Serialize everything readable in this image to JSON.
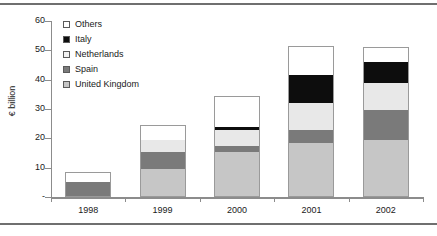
{
  "chart_data": {
    "type": "bar",
    "stacked": true,
    "title": "",
    "xlabel": "",
    "ylabel": "€ billion",
    "categories": [
      "1998",
      "1999",
      "2000",
      "2001",
      "2002"
    ],
    "ylim": [
      0,
      60
    ],
    "yticks": [
      0,
      10,
      20,
      30,
      40,
      50,
      60
    ],
    "ytick_labels": [
      "-",
      "10",
      "20",
      "30",
      "40",
      "50",
      "60"
    ],
    "grid": false,
    "legend_position": "upper left",
    "series": [
      {
        "name": "United Kingdom",
        "color": "#c6c6c6",
        "values": [
          0.0,
          9.5,
          15.5,
          18.5,
          19.5
        ]
      },
      {
        "name": "Spain",
        "color": "#7a7a7a",
        "values": [
          5.0,
          6.0,
          2.0,
          4.5,
          10.0
        ]
      },
      {
        "name": "Netherlands",
        "color": "#e8e8e8",
        "values": [
          0.0,
          4.0,
          5.5,
          9.0,
          9.5
        ]
      },
      {
        "name": "Italy",
        "color": "#0d0d0d",
        "values": [
          0.0,
          0.0,
          1.0,
          9.5,
          7.0
        ]
      },
      {
        "name": "Others",
        "color": "#ffffff",
        "values": [
          3.5,
          5.0,
          10.5,
          10.0,
          5.0
        ]
      }
    ],
    "totals": [
      8.5,
      24.5,
      34.5,
      51.5,
      51.0
    ]
  },
  "legend": {
    "items": [
      {
        "label": "Others",
        "color": "#ffffff"
      },
      {
        "label": "Italy",
        "color": "#0d0d0d"
      },
      {
        "label": "Netherlands",
        "color": "#f2f2f2"
      },
      {
        "label": "Spain",
        "color": "#7a7a7a"
      },
      {
        "label": "United Kingdom",
        "color": "#c6c6c6"
      }
    ]
  }
}
